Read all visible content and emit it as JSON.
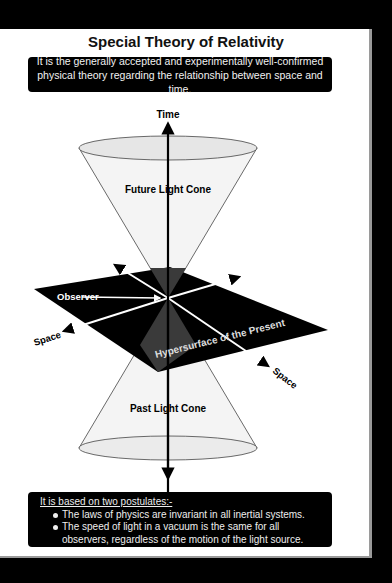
{
  "title": "Special Theory of Relativity",
  "intro": "It is the generally accepted and experimentally well-confirmed physical theory regarding the relationship between space and time.",
  "diagram": {
    "labels": {
      "time": "Time",
      "future_cone": "Future Light Cone",
      "past_cone": "Past Light Cone",
      "observer": "Observer",
      "space_left": "Space",
      "space_right": "Space",
      "hypersurface": "Hypersurface of the Present"
    },
    "colors": {
      "plane": "#000000",
      "cone_fill": "#f0f0f0",
      "cone_intersection": "#3a3a3a",
      "axis": "#000000",
      "space_axes": "#ffffff"
    }
  },
  "postulates": {
    "heading": "It is based on two postulates:-",
    "items": [
      "The laws of physics are invariant in all inertial systems.",
      "The speed of light in a vacuum is the same for all observers, regardless of the motion of the light source."
    ]
  }
}
